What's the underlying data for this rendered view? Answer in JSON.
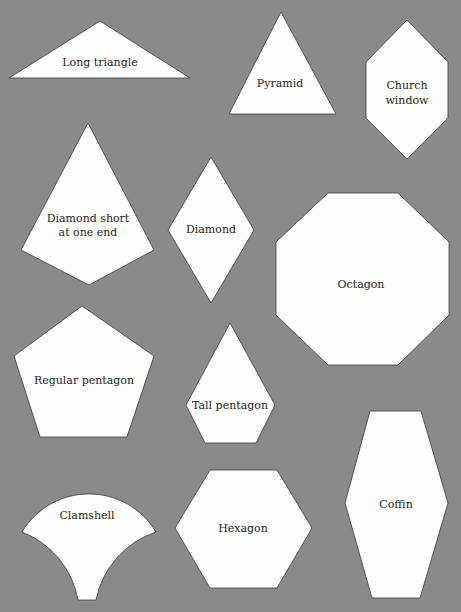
{
  "background_color": "#8a8a8a",
  "shape_fill": "#fdfdfb",
  "shapes": [
    {
      "name": "Long triangle",
      "lines": [
        "Long triangle"
      ]
    },
    {
      "name": "Pyramid",
      "lines": [
        "Pyramid"
      ]
    },
    {
      "name": "Church window",
      "lines": [
        "Church",
        "window"
      ]
    },
    {
      "name": "Diamond short at one end",
      "lines": [
        "Diamond short",
        "at one end"
      ]
    },
    {
      "name": "Diamond",
      "lines": [
        "Diamond"
      ]
    },
    {
      "name": "Octagon",
      "lines": [
        "Octagon"
      ]
    },
    {
      "name": "Regular pentagon",
      "lines": [
        "Regular pentagon"
      ]
    },
    {
      "name": "Tall pentagon",
      "lines": [
        "Tall pentagon"
      ]
    },
    {
      "name": "Clamshell",
      "lines": [
        "Clamshell"
      ]
    },
    {
      "name": "Hexagon",
      "lines": [
        "Hexagon"
      ]
    },
    {
      "name": "Coffin",
      "lines": [
        "Coffin"
      ]
    }
  ]
}
